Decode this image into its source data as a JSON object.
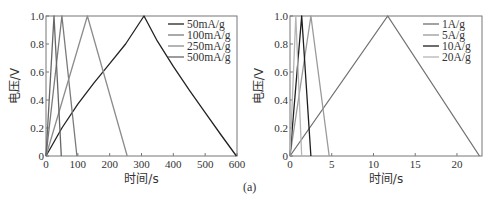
{
  "caption": "(a)",
  "chart_data": [
    {
      "type": "line",
      "title": "",
      "xlabel": "时间/s",
      "ylabel": "电压/V",
      "xlim": [
        0,
        600
      ],
      "ylim": [
        0,
        1.0
      ],
      "xticks": [
        0,
        100,
        200,
        300,
        400,
        500,
        600
      ],
      "xtick_labels": [
        "0",
        "100",
        "200",
        "300",
        "400",
        "500",
        "600"
      ],
      "yticks": [
        0,
        0.2,
        0.4,
        0.6,
        0.8,
        1.0
      ],
      "ytick_labels": [
        "0",
        "0.2",
        "0.4",
        "0.6",
        "0.8",
        "1.0"
      ],
      "grid": false,
      "legend_position": "upper right",
      "series": [
        {
          "name": "50mA/g",
          "color": "#222222",
          "x": [
            0,
            50,
            100,
            150,
            200,
            250,
            308,
            350,
            400,
            450,
            500,
            550,
            598
          ],
          "y": [
            0,
            0.2,
            0.37,
            0.52,
            0.66,
            0.8,
            1.0,
            0.82,
            0.64,
            0.47,
            0.31,
            0.15,
            0
          ]
        },
        {
          "name": "100mA/g",
          "color": "#7a7a7a",
          "x": [
            0,
            50,
            97
          ],
          "y": [
            0,
            1.0,
            0
          ]
        },
        {
          "name": "250mA/g",
          "color": "#8c8c8c",
          "x": [
            0,
            130,
            255
          ],
          "y": [
            0,
            1.0,
            0
          ]
        },
        {
          "name": "500mA/g",
          "color": "#666666",
          "x": [
            0,
            25,
            48
          ],
          "y": [
            0,
            1.0,
            0
          ]
        }
      ]
    },
    {
      "type": "line",
      "title": "",
      "xlabel": "时间/s",
      "ylabel": "电压/V",
      "xlim": [
        0,
        23
      ],
      "ylim": [
        0,
        1.0
      ],
      "xticks": [
        0,
        5,
        10,
        15,
        20
      ],
      "xtick_labels": [
        "0",
        "5",
        "10",
        "15",
        "20"
      ],
      "yticks": [
        0,
        0.2,
        0.4,
        0.6,
        0.8,
        1.0
      ],
      "ytick_labels": [
        "0",
        "0.2",
        "0.4",
        "0.6",
        "0.8",
        "1.0"
      ],
      "grid": false,
      "legend_position": "upper right",
      "series": [
        {
          "name": "1A/g",
          "color": "#707070",
          "x": [
            0,
            11.7,
            22.7
          ],
          "y": [
            0,
            1.0,
            0
          ]
        },
        {
          "name": "5A/g",
          "color": "#9a9a9a",
          "x": [
            0,
            2.5,
            4.7
          ],
          "y": [
            0,
            1.0,
            0
          ]
        },
        {
          "name": "10A/g",
          "color": "#1e1e1e",
          "x": [
            0,
            1.4,
            2.5
          ],
          "y": [
            0,
            1.0,
            0
          ]
        },
        {
          "name": "20A/g",
          "color": "#b5b5b5",
          "x": [
            0,
            0.7,
            1.4
          ],
          "y": [
            0,
            1.0,
            0
          ]
        }
      ]
    }
  ]
}
